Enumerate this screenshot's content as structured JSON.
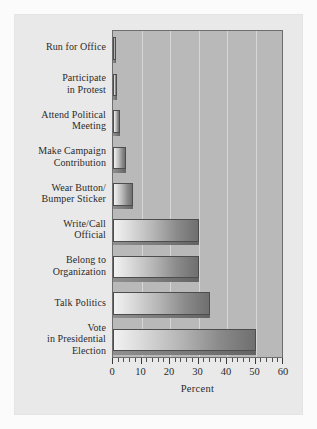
{
  "chart_data": {
    "type": "bar",
    "orientation": "horizontal",
    "title": "",
    "xlabel": "Percent",
    "ylabel": "",
    "xlim": [
      0,
      60
    ],
    "ylim": null,
    "grid": true,
    "legend": null,
    "xticks": [
      "0",
      "10",
      "20",
      "30",
      "40",
      "50",
      "60"
    ],
    "xtick_values": [
      0,
      10,
      20,
      30,
      40,
      50,
      60
    ],
    "minor_tick_step": 2,
    "categories": [
      "Run for Office",
      "Participate in Protest",
      "Attend Political Meeting",
      "Make Campaign Contribution",
      "Wear Button/ Bumper Sticker",
      "Write/Call Official",
      "Belong to Organization",
      "Talk Politics",
      "Vote in Presidential Election"
    ],
    "values": [
      1,
      1.5,
      2.5,
      4.5,
      7,
      30,
      30,
      34,
      50
    ]
  },
  "axis": {
    "xtitle": "Percent",
    "ticklabels": [
      "0",
      "10",
      "20",
      "30",
      "40",
      "50",
      "60"
    ]
  },
  "categories": [
    {
      "id": "run-for-office",
      "lines": [
        "Run for Office"
      ],
      "value": 1
    },
    {
      "id": "participate-protest",
      "lines": [
        "Participate",
        "in Protest"
      ],
      "value": 1.5
    },
    {
      "id": "attend-meeting",
      "lines": [
        "Attend Political",
        "Meeting"
      ],
      "value": 2.5
    },
    {
      "id": "campaign-contribution",
      "lines": [
        "Make Campaign",
        "Contribution"
      ],
      "value": 4.5
    },
    {
      "id": "wear-button",
      "lines": [
        "Wear Button/",
        "Bumper Sticker"
      ],
      "value": 7
    },
    {
      "id": "write-call-official",
      "lines": [
        "Write/Call",
        "Official"
      ],
      "value": 30
    },
    {
      "id": "belong-organization",
      "lines": [
        "Belong to",
        "Organization"
      ],
      "value": 30
    },
    {
      "id": "talk-politics",
      "lines": [
        "Talk Politics"
      ],
      "value": 34
    },
    {
      "id": "vote-presidential",
      "lines": [
        "Vote",
        "in Presidential",
        "Election"
      ],
      "value": 50
    }
  ],
  "colors": {
    "page_background": "#fbfbfb",
    "panel_background": "#e9e9e9",
    "plot_background": "#b9b9b9",
    "gridline": "#d7d7d7",
    "axis_line": "#6e6e6e",
    "bar_light": "#f2f2f2",
    "bar_dark": "#6f6f6f",
    "bar_outline": "#4d4d4d",
    "text": "#2b2b2b"
  }
}
